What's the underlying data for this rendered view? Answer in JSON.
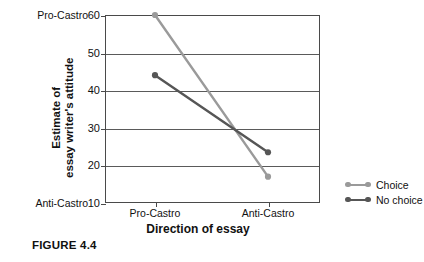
{
  "figure": {
    "caption": "FIGURE 4.4"
  },
  "chart_data": {
    "type": "line",
    "title": "",
    "xlabel": "Direction of essay",
    "ylabel_line1": "Estimate of",
    "ylabel_line2": "essay writer's attitude",
    "categories": [
      "Pro-Castro",
      "Anti-Castro"
    ],
    "x": [
      0,
      1
    ],
    "xlim": [
      -0.38,
      0.92
    ],
    "ylim": [
      10,
      60
    ],
    "yticks": [
      60,
      50,
      40,
      30,
      20,
      10
    ],
    "ytick_labels": [
      "60",
      "50",
      "40",
      "30",
      "20",
      "10"
    ],
    "y_axis_endpoint_labels": {
      "top": "Pro-Castro",
      "bottom": "Anti-Castro"
    },
    "grid": "horizontal",
    "legend_position": "right",
    "series": [
      {
        "name": "Choice",
        "color": "#9a9a9a",
        "values": [
          60,
          17
        ]
      },
      {
        "name": "No choice",
        "color": "#565656",
        "values": [
          44,
          23.5
        ]
      }
    ]
  },
  "legend": {
    "items": [
      {
        "label": "Choice",
        "color": "#9a9a9a"
      },
      {
        "label": "No choice",
        "color": "#565656"
      }
    ]
  }
}
